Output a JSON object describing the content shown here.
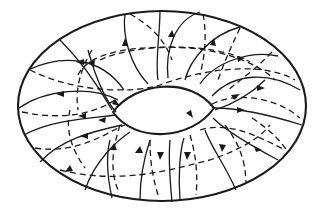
{
  "diagram": {
    "type": "torus-field-lines",
    "colors": {
      "line": "#1a1a1a",
      "background": "#ffffff"
    },
    "outer_boundary": {
      "cx": 162,
      "cy": 106,
      "rx": 144,
      "ry": 96
    },
    "inner_hole": {
      "left_x": 113,
      "right_x": 213,
      "top_y": 83,
      "bottom_y": 140
    },
    "line_styles": [
      "solid-near-side",
      "dashed-far-side"
    ],
    "arrow_count": 22
  }
}
